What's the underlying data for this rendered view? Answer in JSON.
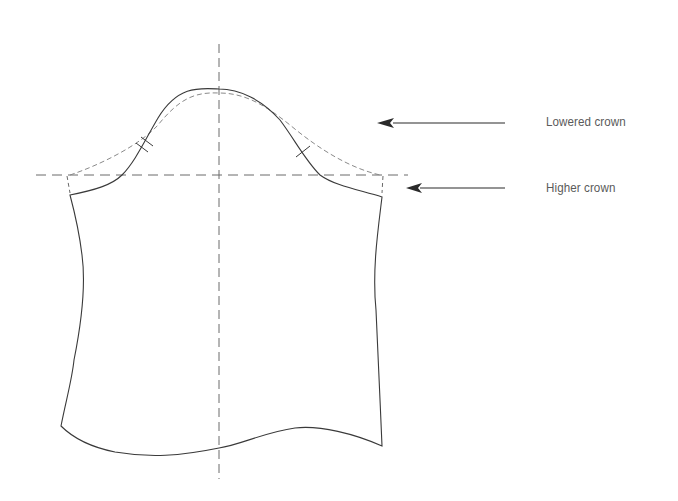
{
  "diagram": {
    "colors": {
      "outline": "#3a3a3a",
      "dashed_guide": "#6a6a6a",
      "lowered_crown_dashed": "#8a8a8a",
      "arrow": "#2a2a2a",
      "label_text": "#5a5a5a",
      "background": "#ffffff"
    },
    "labels": {
      "lowered_crown": "Lowered crown",
      "higher_crown": "Higher crown"
    },
    "annotations": [
      {
        "id": "lowered-crown-arrow",
        "label_key": "lowered_crown",
        "arrow_from": [
          505,
          123
        ],
        "arrow_to": [
          377,
          123
        ]
      },
      {
        "id": "higher-crown-arrow",
        "label_key": "higher_crown",
        "arrow_from": [
          505,
          188
        ],
        "arrow_to": [
          406,
          188
        ]
      }
    ],
    "guides": {
      "vertical_center_line": {
        "x": 219,
        "y_start": 44,
        "y_end": 479,
        "style": "dashed"
      },
      "horizontal_bicep_line": {
        "y": 175,
        "x_start": 36,
        "x_end": 408,
        "style": "dashed"
      }
    },
    "notches": {
      "back": "double notch",
      "front": "single notch"
    }
  }
}
